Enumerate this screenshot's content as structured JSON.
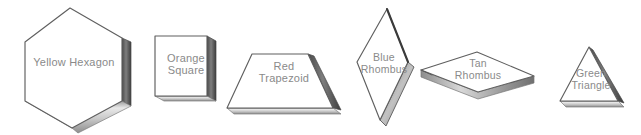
{
  "scene": {
    "title": "Pattern Blocks",
    "background_color": "#ffffff",
    "style": "pencil-sketch",
    "label_color": "#8a8a8a",
    "outline_color": "#5a5a5a"
  },
  "blocks": [
    {
      "id": "yellow-hexagon",
      "color_name": "Yellow",
      "shape_name": "Hexagon",
      "label": "Yellow Hexagon",
      "sides": 6
    },
    {
      "id": "orange-square",
      "color_name": "Orange",
      "shape_name": "Square",
      "label": "Orange\nSquare",
      "sides": 4
    },
    {
      "id": "red-trapezoid",
      "color_name": "Red",
      "shape_name": "Trapezoid",
      "label": "Red\nTrapezoid",
      "sides": 4
    },
    {
      "id": "blue-rhombus",
      "color_name": "Blue",
      "shape_name": "Rhombus",
      "label": "Blue\nRhombus",
      "sides": 4
    },
    {
      "id": "tan-rhombus",
      "color_name": "Tan",
      "shape_name": "Rhombus",
      "label": "Tan\nRhombus",
      "sides": 4
    },
    {
      "id": "green-triangle",
      "color_name": "Green",
      "shape_name": "Triangle",
      "label": "Green\nTriangle",
      "sides": 3
    }
  ]
}
